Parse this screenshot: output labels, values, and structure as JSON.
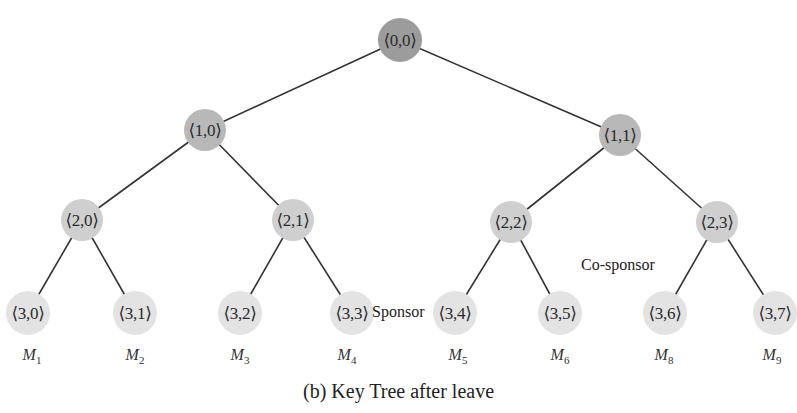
{
  "diagram": {
    "type": "binary-key-tree",
    "caption": "(b) Key Tree after leave",
    "annotations": {
      "sponsor": "Sponsor",
      "co_sponsor": "Co-sponsor"
    },
    "nodes": [
      {
        "id": "0,0",
        "label": "⟨0,0⟩",
        "level": 0,
        "x": 400,
        "y": 40
      },
      {
        "id": "1,0",
        "label": "⟨1,0⟩",
        "level": 1,
        "x": 205,
        "y": 130
      },
      {
        "id": "1,1",
        "label": "⟨1,1⟩",
        "level": 1,
        "x": 620,
        "y": 135
      },
      {
        "id": "2,0",
        "label": "⟨2,0⟩",
        "level": 2,
        "x": 82,
        "y": 220
      },
      {
        "id": "2,1",
        "label": "⟨2,1⟩",
        "level": 2,
        "x": 293,
        "y": 220
      },
      {
        "id": "2,2",
        "label": "⟨2,2⟩",
        "level": 2,
        "x": 511,
        "y": 222
      },
      {
        "id": "2,3",
        "label": "⟨2,3⟩",
        "level": 2,
        "x": 717,
        "y": 222
      },
      {
        "id": "3,0",
        "label": "⟨3,0⟩",
        "level": 3,
        "x": 28,
        "y": 313,
        "member": "M",
        "member_sub": "1"
      },
      {
        "id": "3,1",
        "label": "⟨3,1⟩",
        "level": 3,
        "x": 135,
        "y": 313,
        "member": "M",
        "member_sub": "2"
      },
      {
        "id": "3,2",
        "label": "⟨3,2⟩",
        "level": 3,
        "x": 240,
        "y": 313,
        "member": "M",
        "member_sub": "3"
      },
      {
        "id": "3,3",
        "label": "⟨3,3⟩",
        "level": 3,
        "x": 352,
        "y": 313,
        "member": "M",
        "member_sub": "4"
      },
      {
        "id": "3,4",
        "label": "⟨3,4⟩",
        "level": 3,
        "x": 455,
        "y": 313,
        "member": "M",
        "member_sub": "5"
      },
      {
        "id": "3,5",
        "label": "⟨3,5⟩",
        "level": 3,
        "x": 560,
        "y": 313,
        "member": "M",
        "member_sub": "6"
      },
      {
        "id": "3,6",
        "label": "⟨3,6⟩",
        "level": 3,
        "x": 665,
        "y": 313,
        "member": "M",
        "member_sub": "8"
      },
      {
        "id": "3,7",
        "label": "⟨3,7⟩",
        "level": 3,
        "x": 775,
        "y": 313,
        "member": "M",
        "member_sub": "9"
      }
    ],
    "edges": [
      [
        "0,0",
        "1,0"
      ],
      [
        "0,0",
        "1,1"
      ],
      [
        "1,0",
        "2,0"
      ],
      [
        "1,0",
        "2,1"
      ],
      [
        "1,1",
        "2,2"
      ],
      [
        "1,1",
        "2,3"
      ],
      [
        "2,0",
        "3,0"
      ],
      [
        "2,0",
        "3,1"
      ],
      [
        "2,1",
        "3,2"
      ],
      [
        "2,1",
        "3,3"
      ],
      [
        "2,2",
        "3,4"
      ],
      [
        "2,2",
        "3,5"
      ],
      [
        "2,3",
        "3,6"
      ],
      [
        "2,3",
        "3,7"
      ]
    ],
    "colors": {
      "level0": "#9c9c9c",
      "level1": "#b8b8b8",
      "level2": "#cfcfcf",
      "level3": "#e3e3e3",
      "edge": "#333333"
    }
  }
}
